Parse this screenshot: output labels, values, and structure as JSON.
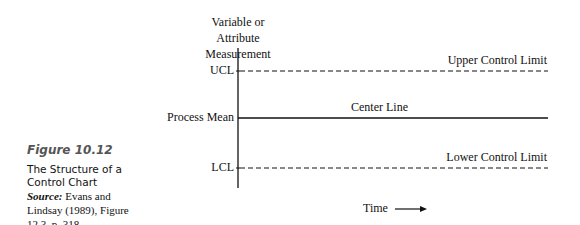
{
  "caption": {
    "figure_number": "Figure 10.12",
    "title": "The Structure of a Control Chart",
    "source_label": "Source:",
    "source_text": "Evans and Lindsay (1989), Figure 12.3, p. 318."
  },
  "diagram": {
    "y_axis_label_line1": "Variable or",
    "y_axis_label_line2": "Attribute Measurement",
    "x_axis_label": "Time",
    "ticks": {
      "ucl": "UCL",
      "mean": "Process Mean",
      "lcl": "LCL"
    },
    "lines": {
      "upper": "Upper Control Limit",
      "center": "Center Line",
      "lower": "Lower Control Limit"
    }
  }
}
